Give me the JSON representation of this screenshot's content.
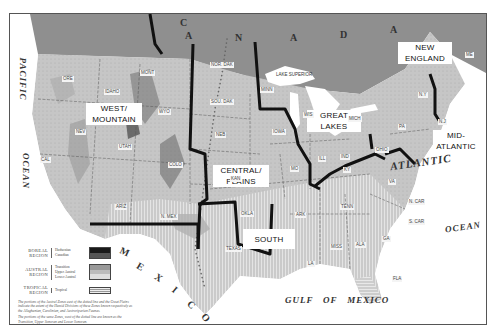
{
  "regions": [
    {
      "id": "west-mountain",
      "label": "WEST/ MOUNTAIN",
      "line1": "WEST/",
      "line2": "MOUNTAIN"
    },
    {
      "id": "central-plains",
      "label": "CENTRAL/ PLAINS",
      "line1": "CENTRAL/",
      "line2": "PLAINS"
    },
    {
      "id": "great-lakes",
      "label": "GREAT LAKES",
      "line1": "GREAT",
      "line2": "LAKES"
    },
    {
      "id": "new-england",
      "label": "NEW ENGLAND",
      "line1": "NEW",
      "line2": "ENGLAND"
    },
    {
      "id": "mid-atlantic",
      "label": "MID-ATLANTIC",
      "line1": "MID-",
      "line2": "ATLANTIC"
    },
    {
      "id": "south",
      "label": "SOUTH",
      "line1": "SOUTH",
      "line2": ""
    }
  ],
  "water_bodies": {
    "pacific": "PACIFIC",
    "pacific_ocean": "OCEAN",
    "atlantic": "ATLANTIC",
    "atlantic_ocean": "OCEAN",
    "gulf": "GULF   OF   MEXICO",
    "lake_superior": "LAKE SUPERIOR"
  },
  "countries": {
    "canada_letters": [
      "C",
      "A",
      "N",
      "A",
      "D",
      "A"
    ],
    "mexico_letters": [
      "M",
      "E",
      "X",
      "I",
      "C",
      "O"
    ]
  },
  "states": [
    "WASH",
    "ORE",
    "CAL",
    "NEV",
    "IDAHO",
    "MONT",
    "WYO",
    "UTAH",
    "COLO",
    "ARIZ",
    "N. MEX",
    "NOR. DAK",
    "SOU. DAK",
    "NEB",
    "KAN",
    "OKLA",
    "TEXAS",
    "MINN",
    "IOWA",
    "MO",
    "ARK",
    "LA",
    "WIS",
    "MICH",
    "ILL",
    "IND",
    "OHIO",
    "KY",
    "TENN",
    "MISS",
    "ALA",
    "GA",
    "FLA",
    "S. CAR",
    "N. CAR",
    "VA",
    "PA",
    "N.Y",
    "N.J",
    "ME",
    "VT",
    "N.H"
  ],
  "legend": {
    "boreal": {
      "region": "BOREAL REGION",
      "zones": [
        "Hudsonian",
        "Canadian"
      ]
    },
    "austral": {
      "region": "AUSTRAL REGION",
      "zones": [
        "Transition",
        "Upper Austral",
        "Lower Austral"
      ]
    },
    "tropical": {
      "region": "TROPICAL REGION",
      "zones": [
        "Tropical"
      ]
    },
    "note1": "The portions of the Austral Zones east of the dotted line and the Great Plains indicate the extent of the Humid Divisions of these Zones known respectively as the Alleghanian, Carolinian, and Austroriparian Faunas.",
    "note2": "The portions of the same Zones, west of the dotted line are known as the Transition, Upper Sonoran and Lower Sonoran."
  },
  "colors": {
    "land": "#c9c9c9",
    "canada": "#8d8d8d",
    "water": "#ffffff",
    "boundary": "#111111",
    "south_hatch": "#d8d8d8"
  }
}
